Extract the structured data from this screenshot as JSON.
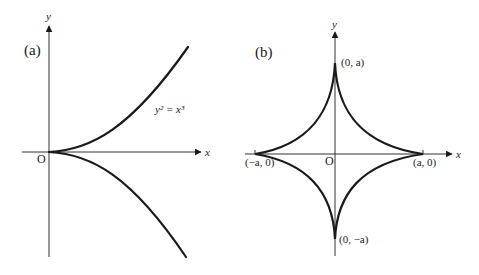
{
  "colors": {
    "background": "#ffffff",
    "curve": "#1a1a1a",
    "axis": "#333333"
  },
  "panels": [
    {
      "id": "a",
      "label": "(a)",
      "x_axis_label": "x",
      "y_axis_label": "y",
      "origin_label": "O",
      "curve_equation": "y² = x³",
      "curve_name": "semicubical parabola"
    },
    {
      "id": "b",
      "label": "(b)",
      "x_axis_label": "x",
      "y_axis_label": "y",
      "origin_label": "O",
      "curve_name": "astroid",
      "points": {
        "top": "(0, a)",
        "bottom": "(0, −a)",
        "left": "(−a, 0)",
        "right": "(a, 0)"
      }
    }
  ]
}
